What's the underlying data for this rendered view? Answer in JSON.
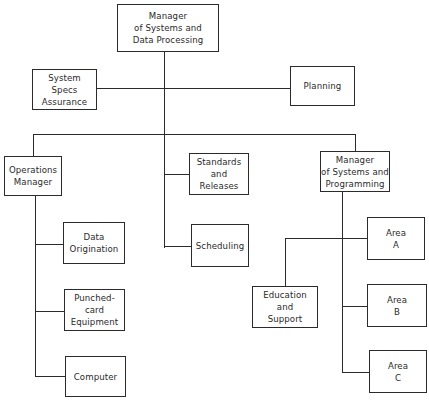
{
  "chart_title": "",
  "org_chart": {
    "root": {
      "label": "Manager\nof Systems and\nData Processing"
    },
    "staff": [
      {
        "label": "System\nSpecs\nAssurance"
      },
      {
        "label": "Planning"
      }
    ],
    "divisions": [
      {
        "label": "Operations\nManager",
        "children": [
          {
            "label": "Data\nOrigination"
          },
          {
            "label": "Punched-\ncard\nEquipment"
          },
          {
            "label": "Computer"
          }
        ]
      },
      {
        "label": "Standards\nand\nReleases"
      },
      {
        "label": "Scheduling"
      },
      {
        "label": "Manager\nof Systems and\nProgramming",
        "children": [
          {
            "label": "Area\nA"
          },
          {
            "label": "Education\nand\nSupport"
          },
          {
            "label": "Area\nB"
          },
          {
            "label": "Area\nC"
          }
        ]
      }
    ]
  }
}
